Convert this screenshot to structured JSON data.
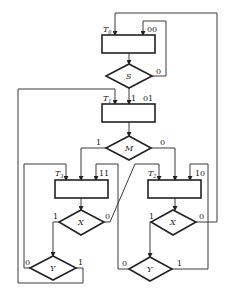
{
  "diagram": {
    "type": "ASM chart (algorithmic state machine)",
    "states": [
      {
        "id": "T0",
        "name": "T",
        "sub": "0",
        "code": "00"
      },
      {
        "id": "T1",
        "name": "T",
        "sub": "1",
        "code": "01"
      },
      {
        "id": "T3",
        "name": "T",
        "sub": "3",
        "code": "11"
      },
      {
        "id": "T2",
        "name": "T",
        "sub": "2",
        "code": "10"
      }
    ],
    "decisions": [
      {
        "id": "S",
        "label": "S",
        "branches": {
          "yes": "1",
          "no": "0"
        }
      },
      {
        "id": "M",
        "label": "M",
        "branches": {
          "yes": "1",
          "no": "0"
        }
      },
      {
        "id": "X_left",
        "label": "X",
        "branches": {
          "yes": "1",
          "no": "0"
        }
      },
      {
        "id": "Y_left",
        "label": "Y",
        "branches": {
          "yes": "1",
          "no": "0"
        }
      },
      {
        "id": "X_right",
        "label": "X",
        "branches": {
          "yes": "1",
          "no": "0"
        }
      },
      {
        "id": "Y_right",
        "label": "Y",
        "branches": {
          "yes": "1",
          "no": "0"
        }
      }
    ],
    "edges": [
      {
        "from": "T0",
        "to": "S"
      },
      {
        "from": "S",
        "to": "T0",
        "label": "0"
      },
      {
        "from": "S",
        "to": "T1",
        "label": "1"
      },
      {
        "from": "T1",
        "to": "M"
      },
      {
        "from": "M",
        "to": "T3",
        "label": "1"
      },
      {
        "from": "M",
        "to": "T2",
        "label": "0"
      },
      {
        "from": "T3",
        "to": "X_left"
      },
      {
        "from": "X_left",
        "to": "Y_left",
        "label": "1"
      },
      {
        "from": "X_left",
        "to": "T2",
        "label": "0"
      },
      {
        "from": "Y_left",
        "to": "T3",
        "label": "0"
      },
      {
        "from": "Y_left",
        "to": "T1",
        "label": "1"
      },
      {
        "from": "T2",
        "to": "X_right"
      },
      {
        "from": "X_right",
        "to": "Y_right",
        "label": "1"
      },
      {
        "from": "X_right",
        "to": "T0",
        "label": "0"
      },
      {
        "from": "Y_right",
        "to": "T3",
        "label": "0"
      },
      {
        "from": "Y_right",
        "to": "T2",
        "label": "1"
      }
    ]
  }
}
